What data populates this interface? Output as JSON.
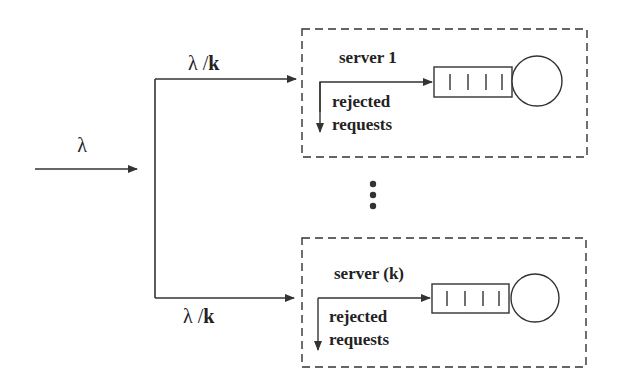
{
  "diagram": {
    "title": "",
    "input": {
      "label": "λ"
    },
    "branches": [
      {
        "label_lambda": "λ",
        "label_sep": " /",
        "label_k": "k"
      },
      {
        "label_lambda": "λ",
        "label_sep": " /",
        "label_k": "k"
      }
    ],
    "servers": [
      {
        "name": "server 1",
        "rejected_line1": "rejected",
        "rejected_line2": "requests",
        "queue_slots": 4
      },
      {
        "name": "server (k)",
        "rejected_line1": "rejected",
        "rejected_line2": "requests",
        "queue_slots": 4
      }
    ],
    "ellipsis": "⋮",
    "colors": {
      "stroke": "#333333",
      "text": "#222222",
      "background": "#ffffff"
    }
  }
}
